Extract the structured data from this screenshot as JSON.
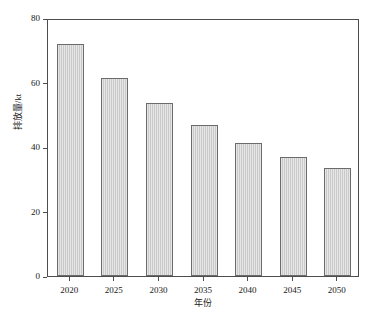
{
  "chart_data": {
    "type": "bar",
    "title": "",
    "subtitle": "",
    "categories": [
      "2020",
      "2025",
      "2030",
      "2035",
      "2040",
      "2045",
      "2050"
    ],
    "values": [
      72.0,
      61.4,
      53.6,
      46.8,
      41.2,
      36.9,
      33.5
    ],
    "xlabel": "年份",
    "ylabel": "排放量/kt",
    "ylim": [
      0,
      80
    ],
    "yticks": [
      0,
      20,
      40,
      60,
      80
    ],
    "ytick_labels": [
      "0",
      "20",
      "40",
      "60",
      "80"
    ],
    "grid": false,
    "legend": null,
    "series": [
      {
        "name": "排放量",
        "values": [
          72.0,
          61.4,
          53.6,
          46.8,
          41.2,
          36.9,
          33.5
        ]
      }
    ],
    "annotations": [],
    "colors": {
      "bar_fill": "#c9c9c9",
      "bar_edge": "#6b6b6b",
      "axis": "#4d4d4d",
      "text": "#202020",
      "background": "#ffffff"
    }
  }
}
